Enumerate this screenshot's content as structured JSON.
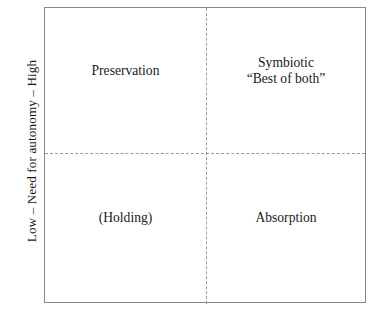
{
  "diagram": {
    "type": "2x2-matrix",
    "axes": {
      "y": {
        "label": "Low – Need for autonomy – High",
        "low_end": "Low",
        "high_end": "High",
        "title": "Need for autonomy",
        "orientation": "vertical-rotated"
      }
    },
    "quadrants": [
      {
        "position": "top-left",
        "lines": [
          "Preservation"
        ]
      },
      {
        "position": "top-right",
        "lines": [
          "Symbiotic",
          "“Best of both”"
        ]
      },
      {
        "position": "bottom-left",
        "lines": [
          "(Holding)"
        ]
      },
      {
        "position": "bottom-right",
        "lines": [
          "Absorption"
        ]
      }
    ],
    "style": {
      "border_color": "#8a8a8a",
      "divider_color": "#9a9a9a",
      "text_color": "#1a1a1a",
      "background": "#ffffff"
    }
  }
}
